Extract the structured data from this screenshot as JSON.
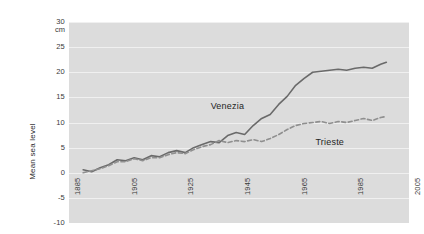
{
  "chart_data": {
    "type": "line",
    "title": "",
    "xlabel": "",
    "ylabel": "Mean sea level",
    "yunit": "cm",
    "xlim": [
      1885,
      2005
    ],
    "ylim": [
      -10,
      30
    ],
    "yticks": [
      30,
      25,
      20,
      15,
      10,
      5,
      0,
      -5,
      -10
    ],
    "xticks": [
      1885,
      1905,
      1925,
      1945,
      1965,
      1985,
      2005
    ],
    "grid": true,
    "legend_position": "inline-annotations",
    "colors": {
      "venezia": "#6a6a6a",
      "trieste": "#8f8f8f",
      "plot_background": "#dcdcdc",
      "gridline": "#f0f0f0",
      "card_background": "#ffffff",
      "text": "#2d2d2d"
    },
    "series": [
      {
        "name": "Venezia",
        "style": "solid",
        "label_x": 1935,
        "label_y": 14.2,
        "x": [
          1890,
          1893,
          1896,
          1899,
          1902,
          1905,
          1908,
          1911,
          1914,
          1917,
          1920,
          1923,
          1926,
          1929,
          1932,
          1935,
          1938,
          1941,
          1944,
          1947,
          1950,
          1953,
          1956,
          1959,
          1962,
          1965,
          1968,
          1971,
          1974,
          1977,
          1980,
          1983,
          1986,
          1989,
          1992,
          1995,
          1997
        ],
        "values": [
          0.6,
          0.2,
          1.0,
          1.6,
          2.6,
          2.4,
          3.0,
          2.6,
          3.4,
          3.2,
          4.0,
          4.4,
          4.0,
          5.0,
          5.6,
          6.2,
          6.0,
          7.4,
          8.0,
          7.6,
          9.4,
          10.8,
          11.6,
          13.6,
          15.2,
          17.4,
          18.8,
          20.0,
          20.2,
          20.4,
          20.6,
          20.4,
          20.8,
          21.0,
          20.8,
          21.6,
          22.0
        ]
      },
      {
        "name": "Trieste",
        "style": "dashed",
        "label_x": 1972,
        "label_y": 7.2,
        "x": [
          1890,
          1893,
          1896,
          1899,
          1902,
          1905,
          1908,
          1911,
          1914,
          1917,
          1920,
          1923,
          1926,
          1929,
          1932,
          1935,
          1938,
          1941,
          1944,
          1947,
          1950,
          1953,
          1956,
          1959,
          1962,
          1965,
          1968,
          1971,
          1974,
          1977,
          1980,
          1983,
          1986,
          1989,
          1992,
          1995,
          1997
        ],
        "values": [
          0.0,
          0.4,
          0.8,
          1.4,
          2.2,
          2.2,
          2.8,
          2.4,
          3.0,
          3.0,
          3.6,
          4.0,
          3.8,
          4.6,
          5.2,
          5.6,
          6.4,
          6.0,
          6.4,
          6.2,
          6.6,
          6.2,
          6.8,
          7.6,
          8.6,
          9.4,
          9.8,
          10.0,
          10.2,
          9.8,
          10.2,
          10.0,
          10.4,
          10.8,
          10.4,
          11.0,
          11.2
        ]
      }
    ]
  }
}
